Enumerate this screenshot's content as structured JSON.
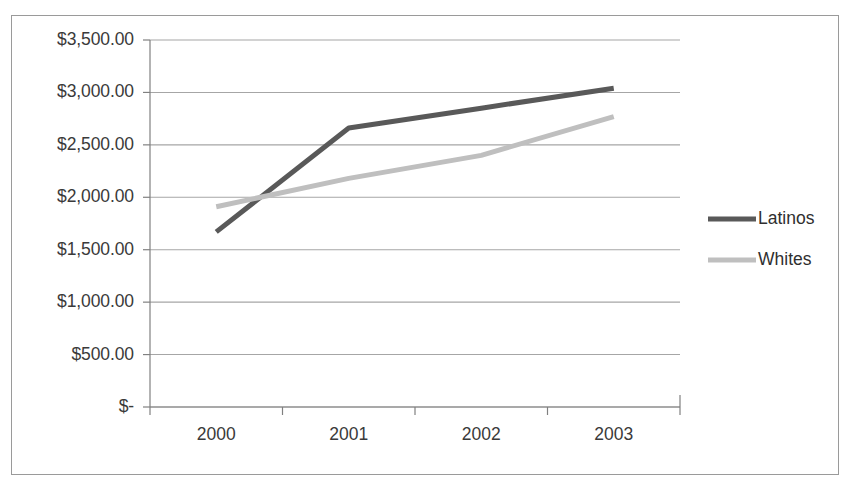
{
  "chart_data": {
    "type": "line",
    "title": "",
    "subtitle": "",
    "xlabel": "",
    "ylabel": "",
    "categories": [
      "2000",
      "2001",
      "2002",
      "2003"
    ],
    "x_tick_labels": [
      "2000",
      "2001",
      "2002",
      "2003"
    ],
    "y_tick_labels": [
      "$3,500.00",
      "$3,000.00",
      "$2,500.00",
      "$2,000.00",
      "$1,500.00",
      "$1,000.00",
      "$500.00",
      "$-"
    ],
    "y_tick_values": [
      3500,
      3000,
      2500,
      2000,
      1500,
      1000,
      500,
      0
    ],
    "ylim": [
      0,
      3500
    ],
    "grid": true,
    "grid_axis": "y",
    "legend_position": "right",
    "series": [
      {
        "name": "Latinos",
        "color": "#595959",
        "values": [
          1670,
          2660,
          2850,
          3040
        ]
      },
      {
        "name": "Whites",
        "color": "#bfbfbf",
        "values": [
          1910,
          2180,
          2400,
          2770
        ]
      }
    ]
  },
  "legend": {
    "entries": [
      {
        "label": "Latinos",
        "color": "#595959"
      },
      {
        "label": "Whites",
        "color": "#bfbfbf"
      }
    ]
  },
  "colors": {
    "latinos": "#595959",
    "whites": "#bfbfbf",
    "gridline": "#a6a6a6",
    "axis": "#808080",
    "frame_border": "#9a9a9a",
    "tick_text": "#3a3a3a",
    "background": "#ffffff"
  }
}
